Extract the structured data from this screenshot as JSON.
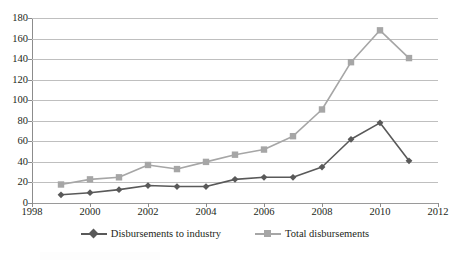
{
  "chart_data": {
    "type": "line",
    "title": "",
    "subtitle": "",
    "xlabel": "",
    "ylabel": "",
    "xlim": [
      1998,
      2012
    ],
    "ylim": [
      0,
      180
    ],
    "x_ticks": [
      1998,
      2000,
      2002,
      2004,
      2006,
      2008,
      2010,
      2012
    ],
    "y_ticks": [
      0,
      20,
      40,
      60,
      80,
      100,
      120,
      140,
      160,
      180
    ],
    "grid": "horizontal",
    "legend_position": "bottom",
    "x": [
      1999,
      2000,
      2001,
      2002,
      2003,
      2004,
      2005,
      2006,
      2007,
      2008,
      2009,
      2010,
      2011
    ],
    "series": [
      {
        "name": "Disbursements to industry",
        "color": "#595959",
        "marker": "diamond",
        "values": [
          8,
          10,
          13,
          17,
          16,
          16,
          23,
          25,
          25,
          35,
          62,
          78,
          41
        ]
      },
      {
        "name": "Total disbursements",
        "color": "#a6a6a6",
        "marker": "square",
        "values": [
          18,
          23,
          25,
          37,
          33,
          40,
          47,
          52,
          65,
          91,
          137,
          168,
          141
        ]
      }
    ]
  },
  "axes": {
    "y_tick_labels": [
      "180",
      "160",
      "140",
      "120",
      "100",
      "80",
      "60",
      "40",
      "20",
      "0"
    ],
    "x_tick_labels": [
      "1998",
      "2000",
      "2002",
      "2004",
      "2006",
      "2008",
      "2010",
      "2012"
    ]
  },
  "legend": {
    "items": [
      {
        "label": "Disbursements to industry",
        "color": "#595959",
        "marker": "diamond"
      },
      {
        "label": "Total disbursements",
        "color": "#a6a6a6",
        "marker": "square"
      }
    ]
  },
  "colors": {
    "series_dark": "#595959",
    "series_light": "#a6a6a6",
    "gridline": "#bfbfbf",
    "axis": "#8c8c8c",
    "text": "#231f20",
    "background": "#ffffff"
  }
}
